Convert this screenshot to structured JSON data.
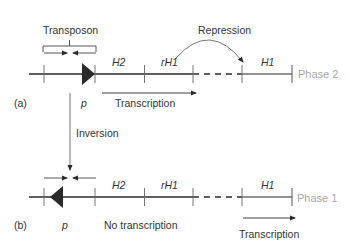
{
  "diagram": {
    "colors": {
      "line": "#2a2a2a",
      "phase_label": "#a8a8a8",
      "text": "#333333"
    },
    "panel_a": {
      "panel_label": "(a)",
      "transposon_label": "Transposon",
      "promoter_label": "p",
      "genes": [
        "H2",
        "rH1",
        "H1"
      ],
      "repression_label": "Repression",
      "transcription_label": "Transcription",
      "phase_label": "Phase 2",
      "promoter_orientation": "right"
    },
    "inversion_label": "Inversion",
    "panel_b": {
      "panel_label": "(b)",
      "promoter_label": "p",
      "genes": [
        "H2",
        "rH1",
        "H1"
      ],
      "no_transcription_label": "No transcription",
      "transcription_label": "Transcription",
      "phase_label": "Phase 1",
      "promoter_orientation": "left"
    }
  }
}
